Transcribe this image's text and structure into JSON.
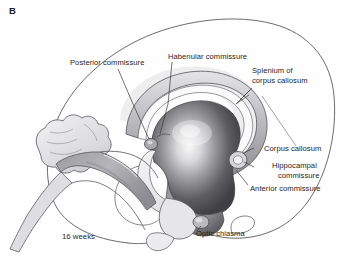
{
  "figure": {
    "panel_label": "B",
    "stage_caption": "16 weeks",
    "background_color": "#fefefe",
    "ink_color": "#262626"
  },
  "labels": {
    "posterior_commissure": "Posterior commissure",
    "habenular_commissure": "Habenular commissure",
    "splenium_line1": "Splenium of",
    "splenium_line2": "corpus callosum",
    "corpus_callosum": "Corpus callosum",
    "hippocampal_line1": "Hippocampal",
    "hippocampal_line2": "commissure",
    "anterior_commissure": "Anterior commissure",
    "optic_chiasma": "Optic chiasma"
  },
  "structures": {
    "cerebral_hemisphere_outline": "cerebral-hemisphere-outline",
    "corpus_callosum_band": "corpus-callosum-band",
    "thalamus_mass": "thalamus-diencephalon-mass",
    "fornix": "fornix",
    "cerebellum": "cerebellum",
    "brainstem": "brainstem",
    "hypothalamus": "hypothalamus",
    "optic_chiasma_nodule": "optic-chiasma-nodule",
    "pineal_region": "pineal-posterior-commissure-region",
    "anterior_commissure_nodule": "anterior-commissure-nodule"
  },
  "colors": {
    "outline_stroke": "#4a4a50",
    "thalamus_dark": "#4b4b4f",
    "thalamus_mid": "#7d7d82",
    "thalamus_highlight": "#f2f2f2",
    "callosum_light": "#cfcfd2",
    "callosum_mid": "#a9a9ae",
    "pale_tissue": "#ececed",
    "leader_line": "#3a3a3a"
  }
}
